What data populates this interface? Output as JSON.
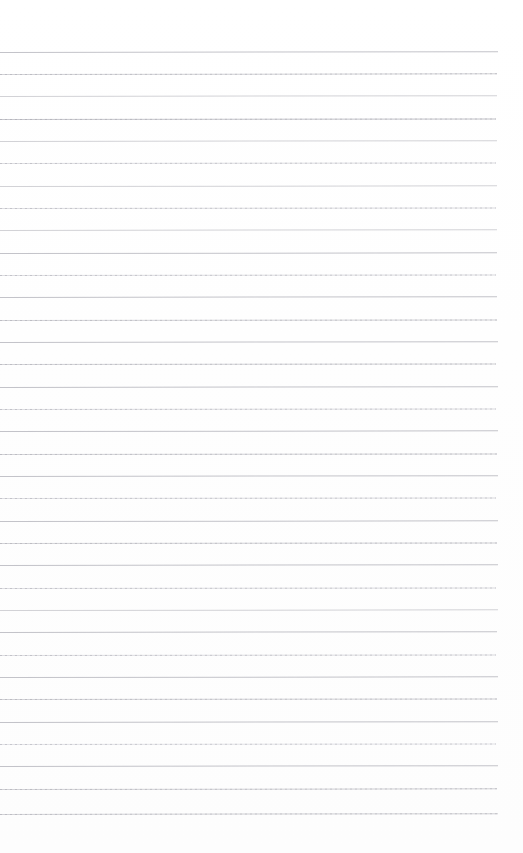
{
  "page": {
    "kind": "scanned-ruled-notebook-page",
    "width": 523,
    "height": 853,
    "background_color": "#ffffff",
    "content_text": ""
  },
  "ruling": {
    "line_count": 35,
    "first_line_y": 52,
    "last_line_y": 814,
    "line_spacing_px": 22.4,
    "line_thickness_px": 1,
    "line_start_x": 0,
    "line_end_x": 498,
    "right_margin_px": 25,
    "top_margin_px": 52,
    "bottom_margin_px": 39,
    "base_line_color": "#d2d2d6",
    "dark_line_color": "#c3c3c9",
    "light_line_color": "#e0e0e4",
    "faint_line_color": "#e8e8ec"
  },
  "lines": [
    {
      "index": 1,
      "y": 52,
      "width": 498,
      "tone": "dark",
      "speckled": false,
      "tilt": -0.1
    },
    {
      "index": 2,
      "y": 74,
      "width": 497,
      "tone": "base",
      "speckled": true,
      "tilt": -0.08
    },
    {
      "index": 3,
      "y": 96,
      "width": 497,
      "tone": "base",
      "speckled": false,
      "tilt": -0.09
    },
    {
      "index": 4,
      "y": 119,
      "width": 496,
      "tone": "dark",
      "speckled": true,
      "tilt": -0.07
    },
    {
      "index": 5,
      "y": 141,
      "width": 497,
      "tone": "base",
      "speckled": false,
      "tilt": -0.09
    },
    {
      "index": 6,
      "y": 163,
      "width": 496,
      "tone": "light",
      "speckled": true,
      "tilt": -0.06
    },
    {
      "index": 7,
      "y": 186,
      "width": 497,
      "tone": "base",
      "speckled": false,
      "tilt": -0.08
    },
    {
      "index": 8,
      "y": 208,
      "width": 496,
      "tone": "light",
      "speckled": true,
      "tilt": -0.07
    },
    {
      "index": 9,
      "y": 230,
      "width": 497,
      "tone": "base",
      "speckled": false,
      "tilt": -0.09
    },
    {
      "index": 10,
      "y": 253,
      "width": 497,
      "tone": "dark",
      "speckled": false,
      "tilt": -0.08
    },
    {
      "index": 11,
      "y": 275,
      "width": 496,
      "tone": "light",
      "speckled": true,
      "tilt": -0.06
    },
    {
      "index": 12,
      "y": 297,
      "width": 497,
      "tone": "dark",
      "speckled": false,
      "tilt": -0.09
    },
    {
      "index": 13,
      "y": 320,
      "width": 497,
      "tone": "base",
      "speckled": true,
      "tilt": -0.07
    },
    {
      "index": 14,
      "y": 342,
      "width": 498,
      "tone": "dark",
      "speckled": false,
      "tilt": -0.1
    },
    {
      "index": 15,
      "y": 364,
      "width": 496,
      "tone": "base",
      "speckled": true,
      "tilt": -0.06
    },
    {
      "index": 16,
      "y": 387,
      "width": 498,
      "tone": "dark",
      "speckled": false,
      "tilt": -0.09
    },
    {
      "index": 17,
      "y": 409,
      "width": 496,
      "tone": "light",
      "speckled": true,
      "tilt": -0.07
    },
    {
      "index": 18,
      "y": 431,
      "width": 498,
      "tone": "dark",
      "speckled": false,
      "tilt": -0.08
    },
    {
      "index": 19,
      "y": 454,
      "width": 497,
      "tone": "base",
      "speckled": true,
      "tilt": -0.07
    },
    {
      "index": 20,
      "y": 476,
      "width": 498,
      "tone": "dark",
      "speckled": false,
      "tilt": -0.09
    },
    {
      "index": 21,
      "y": 498,
      "width": 496,
      "tone": "light",
      "speckled": true,
      "tilt": -0.06
    },
    {
      "index": 22,
      "y": 521,
      "width": 498,
      "tone": "dark",
      "speckled": false,
      "tilt": -0.08
    },
    {
      "index": 23,
      "y": 543,
      "width": 497,
      "tone": "base",
      "speckled": true,
      "tilt": -0.07
    },
    {
      "index": 24,
      "y": 565,
      "width": 498,
      "tone": "dark",
      "speckled": false,
      "tilt": -0.09
    },
    {
      "index": 25,
      "y": 588,
      "width": 496,
      "tone": "light",
      "speckled": true,
      "tilt": -0.06
    },
    {
      "index": 26,
      "y": 610,
      "width": 498,
      "tone": "base",
      "speckled": false,
      "tilt": -0.08
    },
    {
      "index": 27,
      "y": 632,
      "width": 497,
      "tone": "dark",
      "speckled": false,
      "tilt": -0.09
    },
    {
      "index": 28,
      "y": 655,
      "width": 496,
      "tone": "light",
      "speckled": true,
      "tilt": -0.06
    },
    {
      "index": 29,
      "y": 677,
      "width": 498,
      "tone": "dark",
      "speckled": false,
      "tilt": -0.08
    },
    {
      "index": 30,
      "y": 699,
      "width": 497,
      "tone": "base",
      "speckled": true,
      "tilt": -0.07
    },
    {
      "index": 31,
      "y": 722,
      "width": 498,
      "tone": "dark",
      "speckled": false,
      "tilt": -0.09
    },
    {
      "index": 32,
      "y": 744,
      "width": 496,
      "tone": "faint",
      "speckled": true,
      "tilt": -0.06
    },
    {
      "index": 33,
      "y": 766,
      "width": 498,
      "tone": "dark",
      "speckled": false,
      "tilt": -0.1
    },
    {
      "index": 34,
      "y": 789,
      "width": 497,
      "tone": "base",
      "speckled": true,
      "tilt": -0.08
    },
    {
      "index": 35,
      "y": 814,
      "width": 498,
      "tone": "base",
      "speckled": true,
      "tilt": -0.09
    }
  ]
}
